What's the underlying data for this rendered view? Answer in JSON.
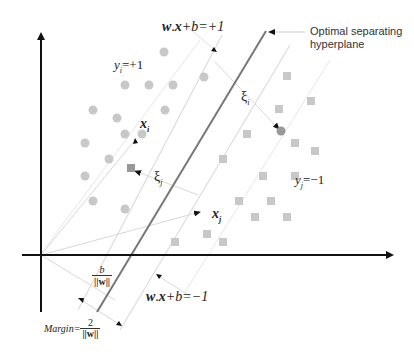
{
  "diagram": {
    "labels": {
      "upper_margin": "w . x + b = +1",
      "upper_margin_parts": {
        "w": "w",
        "dot": ".",
        "x": "x",
        "rest": "+b=+1"
      },
      "lower_margin_parts": {
        "w": "w",
        "dot": ".",
        "x": "x",
        "rest": "+b=−1"
      },
      "hyperplane_line1": "Optimal separating",
      "hyperplane_line2": "hyperplane",
      "class_pos": {
        "y": "y",
        "sub": "i",
        "rest": "=+1"
      },
      "class_neg": {
        "y": "y",
        "sub": "j",
        "rest": "=−1"
      },
      "xi_point": {
        "x": "x",
        "sub": "i"
      },
      "xj_point": {
        "x": "x",
        "sub": "j"
      },
      "slack_i": {
        "xi": "ξ",
        "sub": "i"
      },
      "slack_j": {
        "xi": "ξ",
        "sub": "j"
      },
      "offset": {
        "num": "b",
        "den": "||w||"
      },
      "margin": {
        "label": "Margin=",
        "num": "2",
        "den": "||w||"
      }
    },
    "colors": {
      "axis": "#111111",
      "hyperplane": "#777777",
      "margin_lines": "#dddddd",
      "circle": "#c8c8c8",
      "square": "#c8c8c8",
      "misclassified": "#999999"
    },
    "circles": [
      [
        164,
        52
      ],
      [
        125,
        85
      ],
      [
        149,
        85
      ],
      [
        173,
        85
      ],
      [
        93,
        110
      ],
      [
        117,
        118
      ],
      [
        165,
        110
      ],
      [
        125,
        134
      ],
      [
        142,
        134
      ],
      [
        85,
        143
      ],
      [
        109,
        159
      ],
      [
        85,
        176
      ],
      [
        93,
        201
      ],
      [
        125,
        209
      ],
      [
        204,
        77
      ]
    ],
    "squares": [
      [
        287,
        76
      ],
      [
        311,
        101
      ],
      [
        279,
        109
      ],
      [
        247,
        134
      ],
      [
        295,
        143
      ],
      [
        315,
        151
      ],
      [
        223,
        159
      ],
      [
        263,
        176
      ],
      [
        295,
        176
      ],
      [
        239,
        201
      ],
      [
        271,
        201
      ],
      [
        255,
        217
      ],
      [
        287,
        217
      ],
      [
        175,
        242
      ],
      [
        207,
        234
      ],
      [
        223,
        242
      ]
    ],
    "misclassified_circle": [
      281,
      131
    ],
    "misclassified_square": [
      131,
      168
    ]
  }
}
